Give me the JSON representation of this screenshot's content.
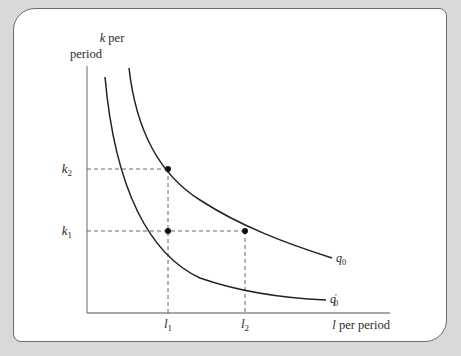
{
  "figure": {
    "y_axis_label_line1": "k per",
    "y_axis_label_line2": "period",
    "y_axis_label_var": "k",
    "y_axis_label_rest": " per",
    "x_axis_label_var": "l",
    "x_axis_label_rest": " per period",
    "y_ticks": [
      {
        "var": "k",
        "sub": "2"
      },
      {
        "var": "k",
        "sub": "1"
      }
    ],
    "x_ticks": [
      {
        "var": "l",
        "sub": "1"
      },
      {
        "var": "l",
        "sub": "2"
      }
    ],
    "curves": [
      {
        "name": "q",
        "sub": "0",
        "prime": ""
      },
      {
        "name": "q",
        "sub": "0",
        "prime": "′"
      }
    ],
    "colors": {
      "background": "#d9d9d9",
      "panel": "#ffffff",
      "axis": "#8a8a8a",
      "curve": "#222222",
      "dash": "#555555"
    }
  }
}
